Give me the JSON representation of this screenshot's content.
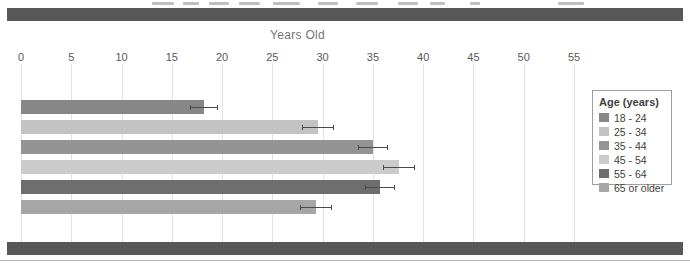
{
  "chart": {
    "axis_title": "Years Old",
    "ticks": [
      0,
      5,
      10,
      15,
      20,
      25,
      30,
      35,
      40,
      45,
      50,
      55
    ]
  },
  "legend": {
    "title": "Age (years)"
  },
  "chart_data": {
    "type": "bar",
    "orientation": "horizontal",
    "title": "",
    "xlabel": "Years Old",
    "ylabel": "",
    "xlim": [
      0,
      55
    ],
    "grid": true,
    "legend_position": "right",
    "legend_title": "Age (years)",
    "categories": [
      "18 - 24",
      "25 - 34",
      "35 - 44",
      "45 - 54",
      "55 - 64",
      "65 or older"
    ],
    "values": [
      18.2,
      29.5,
      35.0,
      37.6,
      35.7,
      29.3
    ],
    "error_bars": [
      1.4,
      1.6,
      1.5,
      1.6,
      1.5,
      1.6
    ],
    "bar_colors": [
      "#878787",
      "#c3c3c3",
      "#949494",
      "#cbcbcb",
      "#6e6e6e",
      "#a6a6a6"
    ]
  },
  "colors": {
    "band": "#575757",
    "gridline": "#e3e3e3",
    "tick_label": "#595959",
    "axis_title": "#757575",
    "error_bar": "#4a4a4a",
    "legend_border": "#9e9e9e",
    "bottom_rule": "#b5b5b5"
  }
}
